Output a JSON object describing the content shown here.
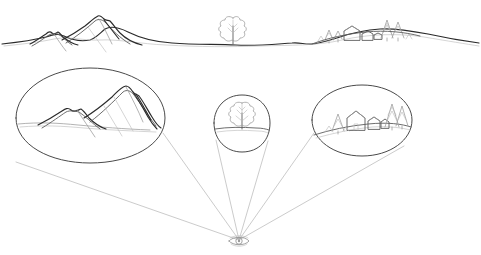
{
  "figure": {
    "title": "",
    "background_color": "#ffffff",
    "width": 481,
    "height": 255,
    "medium": "pencil line drawing"
  },
  "palette": {
    "ink_dark": "#2b2b2b",
    "ink_mid": "#5c5c5c",
    "ink_light": "#9a9a9a",
    "ink_faint": "#b8b8b8",
    "lens_outline": "#4a4a4a",
    "ray": "#aeaeae",
    "paper": "#ffffff"
  },
  "landscape": {
    "name": "main-horizon-panorama",
    "horizon_label": "",
    "features": [
      {
        "name": "small-mountain-peak",
        "x": 52,
        "y": 33
      },
      {
        "name": "large-mountain-peak",
        "x": 99,
        "y": 17
      },
      {
        "name": "deciduous-tree",
        "x": 233,
        "y": 30
      },
      {
        "name": "village-cluster",
        "x": 355,
        "y": 28
      }
    ]
  },
  "lenses": [
    {
      "id": "lens-mountains",
      "name": "magnifier-circle-mountains",
      "content_label": "mountain range",
      "cx": 90,
      "cy": 116,
      "rx": 75,
      "ry": 48
    },
    {
      "id": "lens-tree",
      "name": "magnifier-circle-tree",
      "content_label": "single tree on horizon",
      "cx": 242,
      "cy": 123,
      "rx": 28,
      "ry": 29
    },
    {
      "id": "lens-village",
      "name": "magnifier-circle-village",
      "content_label": "village with houses and conifers",
      "cx": 362,
      "cy": 120,
      "rx": 50,
      "ry": 36
    }
  ],
  "viewpoint": {
    "name": "observer-eye",
    "label": "",
    "x": 239,
    "y": 241
  },
  "sight_lines": {
    "name": "sight-ray-bundle",
    "count": 6,
    "origin_x": 239,
    "origin_y": 240
  }
}
